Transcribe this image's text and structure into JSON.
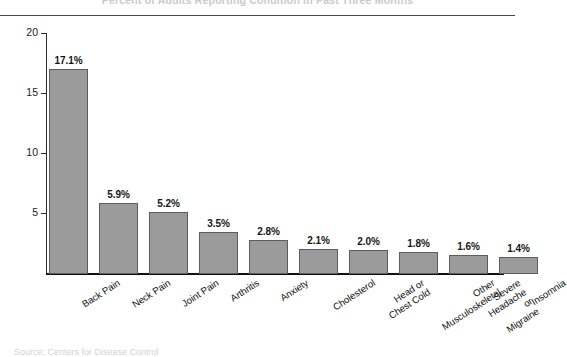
{
  "figure": {
    "title_remnant": "Percent of Adults Reporting Condition in Past Three Months",
    "source_note": "Source: Centers for Disease Control"
  },
  "chart_data": {
    "type": "bar",
    "title": "",
    "subtitle": "",
    "xlabel": "",
    "ylabel": "",
    "ylim": [
      0,
      21
    ],
    "yticks": [
      5,
      10,
      15,
      20
    ],
    "ytick_labels": [
      "5",
      "10",
      "15",
      "20"
    ],
    "grid": false,
    "legend": false,
    "legend_position": "none",
    "bar_color": "#9b9b9b",
    "bar_edge_color": "#5d5d5d",
    "axis_color": "#111111",
    "value_label_suffix": "%",
    "categories": [
      "Back Pain",
      "Neck Pain",
      "Joint Pain",
      "Arthritis",
      "Anxiety",
      "Cholesterol",
      "Head or\nChest Cold",
      "Other\nMusculoskeletal",
      "Severe Headache\nor Migraine",
      "Insomnia"
    ],
    "values": [
      17.1,
      5.9,
      5.2,
      3.5,
      2.8,
      2.1,
      2.0,
      1.8,
      1.6,
      1.4
    ],
    "value_labels": [
      "17.1%",
      "5.9%",
      "5.2%",
      "3.5%",
      "2.8%",
      "2.1%",
      "2.0%",
      "1.8%",
      "1.6%",
      "1.4%"
    ]
  }
}
